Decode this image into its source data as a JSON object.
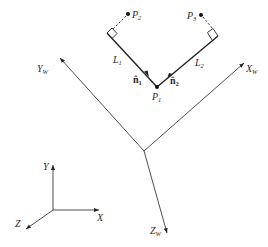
{
  "diagram": {
    "type": "coordinate-frames-geometry",
    "points": {
      "p1": {
        "label": "P",
        "sub": "1",
        "x": 157,
        "y": 87
      },
      "p2": {
        "label": "P",
        "sub": "2",
        "x": 128,
        "y": 14
      },
      "p3": {
        "label": "P",
        "sub": "3",
        "x": 201,
        "y": 15
      }
    },
    "lines": {
      "l1": {
        "label": "L",
        "sub": "1"
      },
      "l2": {
        "label": "L",
        "sub": "2"
      }
    },
    "normals": {
      "n1": {
        "label": "n̂",
        "sub": "1"
      },
      "n2": {
        "label": "n̂",
        "sub": "2"
      }
    },
    "world_axes": {
      "x": {
        "label": "X",
        "sub": "W"
      },
      "y": {
        "label": "Y",
        "sub": "W"
      },
      "z": {
        "label": "Z",
        "sub": "W"
      }
    },
    "local_axes": {
      "x": {
        "label": "X"
      },
      "y": {
        "label": "Y"
      },
      "z": {
        "label": "Z"
      }
    },
    "colors": {
      "line": "#222222",
      "axis": "#3a3a3a",
      "background": "#ffffff"
    }
  }
}
